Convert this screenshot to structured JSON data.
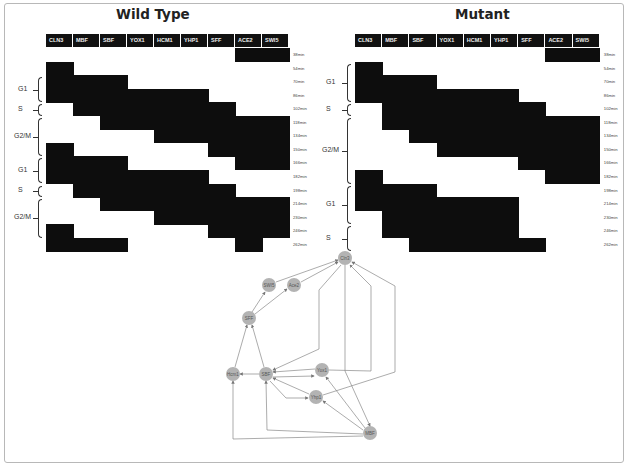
{
  "figure": {
    "panels": [
      {
        "id": "wild_type",
        "title": "Wild Type",
        "columns": [
          "CLN3",
          "MBF",
          "SBF",
          "YOX1",
          "HCM1",
          "YHP1",
          "SFF",
          "ACE2",
          "SWI5"
        ],
        "time_labels": [
          "38min",
          "54min",
          "70min",
          "86min",
          "102min",
          "118min",
          "134min",
          "150min",
          "166min",
          "182min",
          "198min",
          "214min",
          "230min",
          "246min",
          "262min"
        ],
        "phases": [
          {
            "label": "G1",
            "start_row": 2,
            "end_row": 4
          },
          {
            "label": "S",
            "start_row": 4,
            "end_row": 5
          },
          {
            "label": "G2/M",
            "start_row": 5,
            "end_row": 8
          },
          {
            "label": "G1",
            "start_row": 8,
            "end_row": 10
          },
          {
            "label": "S",
            "start_row": 10,
            "end_row": 11
          },
          {
            "label": "G2/M",
            "start_row": 11,
            "end_row": 14
          }
        ],
        "active": [
          [
            7,
            8
          ],
          [
            0
          ],
          [
            0,
            1,
            2
          ],
          [
            0,
            1,
            2,
            3,
            4,
            5
          ],
          [
            1,
            2,
            3,
            4,
            5,
            6
          ],
          [
            2,
            3,
            4,
            5,
            6,
            7,
            8
          ],
          [
            4,
            5,
            6,
            7,
            8
          ],
          [
            0,
            6,
            7,
            8
          ],
          [
            0,
            1,
            2,
            7,
            8
          ],
          [
            0,
            1,
            2,
            3,
            4,
            5
          ],
          [
            1,
            2,
            3,
            4,
            5,
            6
          ],
          [
            2,
            3,
            4,
            5,
            6,
            7,
            8
          ],
          [
            4,
            5,
            6,
            7,
            8
          ],
          [
            0,
            6,
            7,
            8
          ],
          [
            0,
            1,
            2,
            7
          ]
        ]
      },
      {
        "id": "mutant",
        "title": "Mutant",
        "columns": [
          "CLN3",
          "MBF",
          "SBF",
          "YOX1",
          "HCM1",
          "YHP1",
          "SFF",
          "ACE2",
          "SWI5"
        ],
        "time_labels": [
          "38min",
          "54min",
          "70min",
          "86min",
          "102min",
          "118min",
          "134min",
          "150min",
          "166min",
          "182min",
          "198min",
          "214min",
          "230min",
          "246min",
          "262min"
        ],
        "phases": [
          {
            "label": "G1",
            "start_row": 1,
            "end_row": 4
          },
          {
            "label": "S",
            "start_row": 4,
            "end_row": 5
          },
          {
            "label": "G2/M",
            "start_row": 5,
            "end_row": 10
          },
          {
            "label": "G1",
            "start_row": 10,
            "end_row": 13
          },
          {
            "label": "S",
            "start_row": 13,
            "end_row": 15
          }
        ],
        "active": [
          [
            7,
            8
          ],
          [
            0
          ],
          [
            0,
            1,
            2
          ],
          [
            0,
            1,
            2,
            3,
            4,
            5
          ],
          [
            1,
            2,
            3,
            4,
            5,
            6
          ],
          [
            1,
            2,
            3,
            4,
            5,
            6,
            7,
            8
          ],
          [
            2,
            3,
            4,
            5,
            6,
            7,
            8
          ],
          [
            3,
            4,
            5,
            6,
            7,
            8
          ],
          [
            6,
            7,
            8
          ],
          [
            0,
            7,
            8
          ],
          [
            0,
            1,
            2
          ],
          [
            0,
            1,
            2,
            3,
            4,
            5
          ],
          [
            1,
            2,
            3,
            4,
            5
          ],
          [
            1,
            2,
            3,
            4,
            5
          ],
          [
            2,
            3,
            4,
            5,
            6
          ]
        ]
      }
    ],
    "network": {
      "nodes": [
        {
          "id": "Cln3",
          "label": "Cln3",
          "x": 345,
          "y": 258
        },
        {
          "id": "SWI5",
          "label": "SWI5",
          "x": 269,
          "y": 285
        },
        {
          "id": "Ace2",
          "label": "Ace2",
          "x": 294,
          "y": 285
        },
        {
          "id": "SFF",
          "label": "SFF",
          "x": 249,
          "y": 318
        },
        {
          "id": "Hcm1",
          "label": "Hcm1",
          "x": 233,
          "y": 374
        },
        {
          "id": "SBF",
          "label": "SBF",
          "x": 266,
          "y": 374
        },
        {
          "id": "Yox1",
          "label": "Yox1",
          "x": 322,
          "y": 370
        },
        {
          "id": "Yhp1",
          "label": "Yhp1",
          "x": 316,
          "y": 397
        },
        {
          "id": "MBF",
          "label": "MBF",
          "x": 370,
          "y": 433
        }
      ],
      "edges": [
        {
          "from": "SWI5",
          "to": "Cln3",
          "path": "M276,282 L338,260"
        },
        {
          "from": "Ace2",
          "to": "Cln3",
          "path": "M301,282 L338,262"
        },
        {
          "from": "SFF",
          "to": "SWI5",
          "path": "M252,312 L265,292"
        },
        {
          "from": "SFF",
          "to": "Ace2",
          "path": "M255,314 L287,289"
        },
        {
          "from": "Hcm1",
          "to": "SFF",
          "path": "M235,367 L247,325"
        },
        {
          "from": "SBF",
          "to": "SFF",
          "path": "M264,367 L252,325"
        },
        {
          "from": "SBF",
          "to": "Hcm1",
          "path": "M259,374 L240,374"
        },
        {
          "from": "Cln3",
          "to": "SBF",
          "path": "M341,265 L319,290 L319,349 L273,370"
        },
        {
          "from": "Yox1",
          "to": "SBF",
          "path": "M315,369 L273,372"
        },
        {
          "from": "SBF",
          "to": "Yox1",
          "path": "M273,377 L314,376"
        },
        {
          "from": "Yhp1",
          "to": "SBF",
          "path": "M309,394 L273,378"
        },
        {
          "from": "SBF",
          "to": "Yhp1",
          "path": "M270,381 L286,398 L308,398"
        },
        {
          "from": "MBF",
          "to": "Yox1",
          "path": "M365,428 L326,377"
        },
        {
          "from": "MBF",
          "to": "Yhp1",
          "path": "M363,430 L323,401"
        },
        {
          "from": "MBF",
          "to": "SBF",
          "path": "M363,434 L267,430 L266,381"
        },
        {
          "from": "MBF",
          "to": "Hcm1",
          "path": "M363,436 L233,439 L233,381"
        },
        {
          "from": "Cln3",
          "to": "MBF",
          "path": "M345,265 L345,371 L370,426"
        },
        {
          "from": "Yox1",
          "to": "Cln3",
          "path": "M329,370 L371,371 L371,286 L350,265"
        },
        {
          "from": "Yhp1",
          "to": "Cln3",
          "path": "M323,395 L395,372 L395,286 L352,262"
        }
      ]
    },
    "caption": ""
  }
}
